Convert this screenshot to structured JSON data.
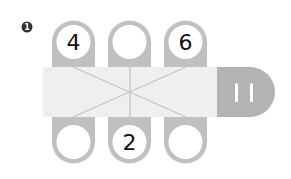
{
  "problem": {
    "number": "1",
    "badge_color": "#333333"
  },
  "colors": {
    "table": "#efefef",
    "seat": "#c0c0c0",
    "line": "#c0c0c0",
    "end_block": "#b3b3b3",
    "circle_fill": "#ffffff",
    "text": "#111111"
  },
  "top_seats": [
    {
      "label": "4"
    },
    {
      "label": ""
    },
    {
      "label": "6"
    }
  ],
  "bottom_seats": [
    {
      "label": ""
    },
    {
      "label": "2"
    },
    {
      "label": ""
    }
  ],
  "end_block": {
    "label": "11"
  }
}
